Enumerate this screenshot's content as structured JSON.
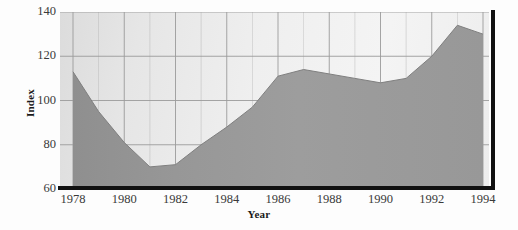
{
  "chart_data": {
    "type": "area",
    "title": "",
    "xlabel": "Year",
    "ylabel": "Index",
    "x": [
      1978,
      1979,
      1980,
      1981,
      1982,
      1983,
      1984,
      1985,
      1986,
      1987,
      1988,
      1989,
      1990,
      1991,
      1992,
      1993,
      1994
    ],
    "values": [
      113,
      95,
      81,
      70,
      71,
      80,
      88,
      97,
      111,
      114,
      112,
      110,
      108,
      110,
      120,
      134,
      130
    ],
    "series": [
      {
        "name": "Index",
        "values": [
          113,
          95,
          81,
          70,
          71,
          80,
          88,
          97,
          111,
          114,
          112,
          110,
          108,
          110,
          120,
          134,
          130
        ]
      }
    ],
    "xlim": [
      1978,
      1994
    ],
    "ylim": [
      60,
      140
    ],
    "x_ticks": [
      1978,
      1980,
      1982,
      1984,
      1986,
      1988,
      1990,
      1992,
      1994
    ],
    "x_tick_labels": [
      "1978",
      "1980",
      "1982",
      "1984",
      "1986",
      "1988",
      "1990",
      "1992",
      "1994"
    ],
    "y_ticks": [
      60,
      80,
      100,
      120,
      140
    ],
    "y_tick_labels": [
      "60",
      "80",
      "100",
      "120",
      "140"
    ],
    "grid": true,
    "legend": "none",
    "fill_color": "#9a9a9a",
    "line_color": "#8a8a8a",
    "plot_bg_color": "#ededed",
    "grid_color": "#9b9b9b",
    "axis_color": "#111111"
  },
  "axes": {
    "y_title": "Index",
    "x_title": "Year"
  }
}
